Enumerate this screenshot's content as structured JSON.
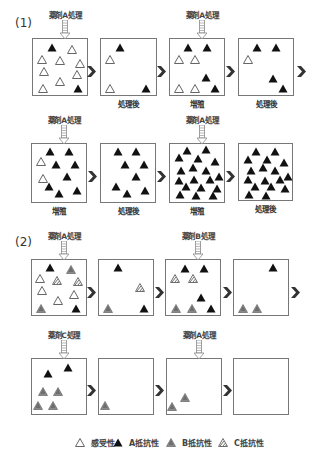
{
  "colors": {
    "a_resistant": "#111111",
    "b_resistant": "#8a8a8a",
    "c_resistant": "#6e6e6e",
    "susceptible_stroke": "#666666",
    "box_border": "#777777",
    "chevron": "#333333"
  },
  "sections": [
    {
      "label": "(1)",
      "rows": [
        {
          "boxes": [
            {
              "treatment": "薬剤A処理",
              "caption": "",
              "x": 32,
              "y": 38,
              "w": 56,
              "h": 58,
              "items": [
                {
                  "t": "A",
                  "x": 47,
                  "y": 43
                },
                {
                  "t": "S",
                  "x": 67,
                  "y": 45
                },
                {
                  "t": "S",
                  "x": 37,
                  "y": 55
                },
                {
                  "t": "S",
                  "x": 55,
                  "y": 56
                },
                {
                  "t": "S",
                  "x": 75,
                  "y": 59
                },
                {
                  "t": "S",
                  "x": 39,
                  "y": 67
                },
                {
                  "t": "S",
                  "x": 72,
                  "y": 70
                },
                {
                  "t": "S",
                  "x": 55,
                  "y": 77
                },
                {
                  "t": "S",
                  "x": 38,
                  "y": 84
                },
                {
                  "t": "A",
                  "x": 73,
                  "y": 84
                }
              ]
            },
            {
              "treatment": "",
              "caption": "処理後",
              "x": 100,
              "y": 38,
              "w": 57,
              "h": 58,
              "items": [
                {
                  "t": "A",
                  "x": 115,
                  "y": 43
                },
                {
                  "t": "S",
                  "x": 105,
                  "y": 55
                },
                {
                  "t": "S",
                  "x": 105,
                  "y": 84
                },
                {
                  "t": "A",
                  "x": 141,
                  "y": 84
                }
              ]
            },
            {
              "treatment": "薬剤A処理",
              "caption": "増殖",
              "x": 169,
              "y": 38,
              "w": 56,
              "h": 58,
              "items": [
                {
                  "t": "A",
                  "x": 183,
                  "y": 43
                },
                {
                  "t": "A",
                  "x": 202,
                  "y": 43
                },
                {
                  "t": "S",
                  "x": 174,
                  "y": 55
                },
                {
                  "t": "S",
                  "x": 190,
                  "y": 55
                },
                {
                  "t": "A",
                  "x": 201,
                  "y": 73
                },
                {
                  "t": "S",
                  "x": 174,
                  "y": 84
                },
                {
                  "t": "S",
                  "x": 190,
                  "y": 84
                },
                {
                  "t": "A",
                  "x": 210,
                  "y": 84
                }
              ]
            },
            {
              "treatment": "",
              "caption": "処理後",
              "x": 238,
              "y": 38,
              "w": 56,
              "h": 58,
              "items": [
                {
                  "t": "A",
                  "x": 252,
                  "y": 43
                },
                {
                  "t": "A",
                  "x": 271,
                  "y": 43
                },
                {
                  "t": "S",
                  "x": 243,
                  "y": 55
                },
                {
                  "t": "A",
                  "x": 268,
                  "y": 74
                },
                {
                  "t": "A",
                  "x": 278,
                  "y": 84
                }
              ]
            }
          ],
          "chevrons": [
            {
              "x": 87,
              "y": 62
            },
            {
              "x": 157,
              "y": 62
            },
            {
              "x": 226,
              "y": 62
            },
            {
              "x": 297,
              "y": 62
            }
          ],
          "caption_y": 99
        },
        {
          "boxes": [
            {
              "treatment": "薬剤A処理",
              "caption": "増殖",
              "x": 31,
              "y": 143,
              "w": 56,
              "h": 60,
              "items": [
                {
                  "t": "A",
                  "x": 45,
                  "y": 147
                },
                {
                  "t": "A",
                  "x": 64,
                  "y": 147
                },
                {
                  "t": "S",
                  "x": 36,
                  "y": 157
                },
                {
                  "t": "A",
                  "x": 51,
                  "y": 160
                },
                {
                  "t": "A",
                  "x": 70,
                  "y": 160
                },
                {
                  "t": "S",
                  "x": 38,
                  "y": 174
                },
                {
                  "t": "A",
                  "x": 62,
                  "y": 172
                },
                {
                  "t": "A",
                  "x": 44,
                  "y": 182
                },
                {
                  "t": "A",
                  "x": 72,
                  "y": 186
                },
                {
                  "t": "A",
                  "x": 54,
                  "y": 189
                }
              ]
            },
            {
              "treatment": "",
              "caption": "処理後",
              "x": 100,
              "y": 143,
              "w": 56,
              "h": 60,
              "items": [
                {
                  "t": "A",
                  "x": 113,
                  "y": 147
                },
                {
                  "t": "A",
                  "x": 131,
                  "y": 147
                },
                {
                  "t": "A",
                  "x": 120,
                  "y": 160
                },
                {
                  "t": "A",
                  "x": 139,
                  "y": 160
                },
                {
                  "t": "A",
                  "x": 131,
                  "y": 172
                },
                {
                  "t": "A",
                  "x": 111,
                  "y": 182
                },
                {
                  "t": "A",
                  "x": 140,
                  "y": 186
                },
                {
                  "t": "A",
                  "x": 122,
                  "y": 189
                }
              ]
            },
            {
              "treatment": "薬剤A処理",
              "caption": "増殖",
              "x": 169,
              "y": 143,
              "w": 56,
              "h": 60,
              "items": [
                {
                  "t": "A",
                  "x": 182,
                  "y": 146
                },
                {
                  "t": "A",
                  "x": 201,
                  "y": 145
                },
                {
                  "t": "A",
                  "x": 174,
                  "y": 153
                },
                {
                  "t": "A",
                  "x": 193,
                  "y": 154
                },
                {
                  "t": "A",
                  "x": 210,
                  "y": 157
                },
                {
                  "t": "A",
                  "x": 188,
                  "y": 163
                },
                {
                  "t": "A",
                  "x": 176,
                  "y": 166
                },
                {
                  "t": "A",
                  "x": 201,
                  "y": 166
                },
                {
                  "t": "A",
                  "x": 174,
                  "y": 176
                },
                {
                  "t": "A",
                  "x": 189,
                  "y": 175
                },
                {
                  "t": "A",
                  "x": 205,
                  "y": 175
                },
                {
                  "t": "A",
                  "x": 214,
                  "y": 172
                },
                {
                  "t": "A",
                  "x": 181,
                  "y": 182
                },
                {
                  "t": "A",
                  "x": 196,
                  "y": 183
                },
                {
                  "t": "A",
                  "x": 212,
                  "y": 184
                },
                {
                  "t": "A",
                  "x": 175,
                  "y": 190
                },
                {
                  "t": "A",
                  "x": 191,
                  "y": 191
                },
                {
                  "t": "A",
                  "x": 208,
                  "y": 191
                }
              ]
            },
            {
              "treatment": "",
              "caption": "処理後",
              "x": 238,
              "y": 143,
              "w": 55,
              "h": 58,
              "items": [
                {
                  "t": "A",
                  "x": 251,
                  "y": 147
                },
                {
                  "t": "A",
                  "x": 270,
                  "y": 147
                },
                {
                  "t": "A",
                  "x": 243,
                  "y": 155
                },
                {
                  "t": "A",
                  "x": 262,
                  "y": 155
                },
                {
                  "t": "A",
                  "x": 279,
                  "y": 158
                },
                {
                  "t": "A",
                  "x": 258,
                  "y": 163
                },
                {
                  "t": "A",
                  "x": 246,
                  "y": 166
                },
                {
                  "t": "A",
                  "x": 270,
                  "y": 166
                },
                {
                  "t": "A",
                  "x": 243,
                  "y": 175
                },
                {
                  "t": "A",
                  "x": 260,
                  "y": 176
                },
                {
                  "t": "A",
                  "x": 275,
                  "y": 175
                },
                {
                  "t": "A",
                  "x": 283,
                  "y": 172
                },
                {
                  "t": "A",
                  "x": 250,
                  "y": 182
                },
                {
                  "t": "A",
                  "x": 266,
                  "y": 182
                },
                {
                  "t": "A",
                  "x": 280,
                  "y": 184
                },
                {
                  "t": "A",
                  "x": 244,
                  "y": 190
                },
                {
                  "t": "A",
                  "x": 261,
                  "y": 191
                }
              ]
            }
          ],
          "chevrons": [
            {
              "x": 88,
              "y": 167
            },
            {
              "x": 157,
              "y": 167
            },
            {
              "x": 226,
              "y": 167
            }
          ],
          "caption_y": 205
        }
      ]
    },
    {
      "label": "(2)",
      "rows": [
        {
          "boxes": [
            {
              "treatment": "薬剤A処理",
              "caption": "",
              "x": 31,
              "y": 259,
              "w": 56,
              "h": 57,
              "items": [
                {
                  "t": "A",
                  "x": 45,
                  "y": 263
                },
                {
                  "t": "B",
                  "x": 66,
                  "y": 265
                },
                {
                  "t": "S",
                  "x": 35,
                  "y": 274
                },
                {
                  "t": "C",
                  "x": 52,
                  "y": 276
                },
                {
                  "t": "C",
                  "x": 73,
                  "y": 277
                },
                {
                  "t": "S",
                  "x": 37,
                  "y": 286
                },
                {
                  "t": "S",
                  "x": 69,
                  "y": 290
                },
                {
                  "t": "S",
                  "x": 53,
                  "y": 296
                },
                {
                  "t": "B",
                  "x": 36,
                  "y": 304
                },
                {
                  "t": "A",
                  "x": 71,
                  "y": 304
                }
              ]
            },
            {
              "treatment": "",
              "caption": "",
              "x": 98,
              "y": 259,
              "w": 56,
              "h": 57,
              "items": [
                {
                  "t": "A",
                  "x": 113,
                  "y": 263
                },
                {
                  "t": "C",
                  "x": 135,
                  "y": 283
                },
                {
                  "t": "B",
                  "x": 103,
                  "y": 304
                },
                {
                  "t": "A",
                  "x": 139,
                  "y": 304
                }
              ]
            },
            {
              "treatment": "薬剤B処理",
              "caption": "",
              "x": 165,
              "y": 259,
              "w": 56,
              "h": 57,
              "items": [
                {
                  "t": "A",
                  "x": 180,
                  "y": 264
                },
                {
                  "t": "A",
                  "x": 199,
                  "y": 264
                },
                {
                  "t": "C",
                  "x": 170,
                  "y": 274
                },
                {
                  "t": "C",
                  "x": 188,
                  "y": 274
                },
                {
                  "t": "A",
                  "x": 196,
                  "y": 293
                },
                {
                  "t": "B",
                  "x": 171,
                  "y": 304
                },
                {
                  "t": "B",
                  "x": 187,
                  "y": 304
                },
                {
                  "t": "A",
                  "x": 206,
                  "y": 304
                }
              ]
            },
            {
              "treatment": "",
              "caption": "",
              "x": 233,
              "y": 259,
              "w": 56,
              "h": 57,
              "items": [
                {
                  "t": "A",
                  "x": 268,
                  "y": 263
                },
                {
                  "t": "B",
                  "x": 238,
                  "y": 304
                },
                {
                  "t": "B",
                  "x": 252,
                  "y": 304
                }
              ]
            }
          ],
          "chevrons": [
            {
              "x": 87,
              "y": 283
            },
            {
              "x": 155,
              "y": 283
            },
            {
              "x": 223,
              "y": 283
            },
            {
              "x": 291,
              "y": 283
            }
          ],
          "caption_y": 0
        },
        {
          "boxes": [
            {
              "treatment": "薬剤C処理",
              "caption": "",
              "x": 31,
              "y": 358,
              "w": 56,
              "h": 57,
              "items": [
                {
                  "t": "A",
                  "x": 63,
                  "y": 363
                },
                {
                  "t": "A",
                  "x": 43,
                  "y": 369
                },
                {
                  "t": "B",
                  "x": 38,
                  "y": 387
                },
                {
                  "t": "B",
                  "x": 53,
                  "y": 387
                },
                {
                  "t": "B",
                  "x": 33,
                  "y": 401
                },
                {
                  "t": "B",
                  "x": 48,
                  "y": 401
                }
              ]
            },
            {
              "treatment": "",
              "caption": "",
              "x": 98,
              "y": 358,
              "w": 56,
              "h": 57,
              "items": [
                {
                  "t": "B",
                  "x": 100,
                  "y": 401
                }
              ]
            },
            {
              "treatment": "薬剤A処理",
              "caption": "",
              "x": 166,
              "y": 358,
              "w": 56,
              "h": 57,
              "items": [
                {
                  "t": "B",
                  "x": 180,
                  "y": 393
                },
                {
                  "t": "B",
                  "x": 167,
                  "y": 402
                }
              ]
            },
            {
              "treatment": "",
              "caption": "",
              "x": 233,
              "y": 358,
              "w": 56,
              "h": 57,
              "items": []
            }
          ],
          "chevrons": [
            {
              "x": 87,
              "y": 381
            },
            {
              "x": 155,
              "y": 381
            },
            {
              "x": 223,
              "y": 381
            }
          ],
          "caption_y": 0
        }
      ]
    }
  ],
  "section_labels": [
    {
      "text": "(1)",
      "x": 15,
      "y": 16
    },
    {
      "text": "(2)",
      "x": 15,
      "y": 235
    }
  ],
  "legend": [
    {
      "type": "S",
      "label": "感受性",
      "x": 75
    },
    {
      "type": "A",
      "label": "A抵抗性",
      "x": 113
    },
    {
      "type": "B",
      "label": "B抵抗性",
      "x": 166
    },
    {
      "type": "C",
      "label": "C抵抗性",
      "x": 218
    }
  ]
}
